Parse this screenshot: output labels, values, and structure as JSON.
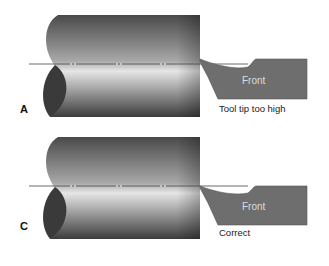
{
  "diagram": {
    "type": "lathe tool height illustration",
    "panels": [
      {
        "id": "A",
        "letter": "A",
        "tool_label": "Front",
        "caption": "Tool tip too high"
      },
      {
        "id": "C",
        "letter": "C",
        "tool_label": "Front",
        "caption": "Correct"
      }
    ],
    "colors": {
      "workpiece_dark": "#4a4a4a",
      "workpiece_light": "#e8e8e8",
      "workpiece_end": "#3a3a3a",
      "tool": "#6e6e6e",
      "tool_text": "#d8d8d8",
      "centerline": "#444444"
    }
  }
}
